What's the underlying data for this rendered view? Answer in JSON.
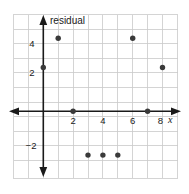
{
  "chart_data": {
    "type": "scatter",
    "title": "",
    "xlabel": "x",
    "ylabel": "residual",
    "x": [
      0,
      1,
      2,
      3,
      4,
      5,
      6,
      7,
      8
    ],
    "values": [
      3,
      5,
      0,
      -3,
      -3,
      -3,
      5,
      0,
      3
    ],
    "points": [
      {
        "x": 0,
        "y": 3
      },
      {
        "x": 1,
        "y": 5
      },
      {
        "x": 2,
        "y": 0
      },
      {
        "x": 3,
        "y": -3
      },
      {
        "x": 4,
        "y": -3
      },
      {
        "x": 5,
        "y": -3
      },
      {
        "x": 6,
        "y": 5
      },
      {
        "x": 7,
        "y": 0
      },
      {
        "x": 8,
        "y": 3
      }
    ],
    "xlim": [
      -2,
      9
    ],
    "ylim": [
      -4,
      6
    ],
    "x_ticks": [
      2,
      4,
      6,
      8
    ],
    "x_tick_labels": [
      "2",
      "4",
      "6",
      "8"
    ],
    "y_ticks": [
      4,
      2,
      -2
    ],
    "y_tick_labels": [
      "4",
      "2",
      "−2"
    ],
    "grid": true,
    "legend": "none",
    "axis_arrows": "both",
    "colors": {
      "grid": "#c9c9c9",
      "axis": "#1a1a1a",
      "point": "#3a3a3a",
      "background": "#ffffff",
      "text": "#1a1a1a"
    }
  },
  "labels": {
    "y_axis_title": "residual",
    "x_axis_title": "x",
    "x_tick_2": "2",
    "x_tick_4": "4",
    "x_tick_6": "6",
    "x_tick_8": "8",
    "y_tick_4": "4",
    "y_tick_2": "2",
    "y_tick_neg2": "−2"
  }
}
